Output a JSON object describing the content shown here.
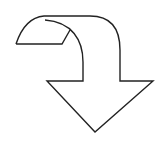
{
  "figure": {
    "description": "Curved down-turning arrow outline",
    "icon": "curved-arrow-down-icon",
    "stroke_color": "#222222",
    "fill_color": "#ffffff",
    "background": "#ffffff"
  }
}
